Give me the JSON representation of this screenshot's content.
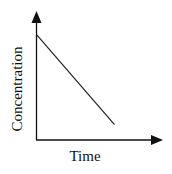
{
  "chart_data": {
    "type": "line",
    "title": "",
    "xlabel": "Time",
    "ylabel": "Concentration",
    "grid": false,
    "legend": null,
    "axis_ticks": false,
    "series": [
      {
        "name": "Concentration vs Time",
        "description": "Linear decrease (zero-order kinetics)",
        "x": [
          0,
          0.62
        ],
        "y": [
          0.82,
          0.12
        ]
      }
    ],
    "xlim": [
      0,
      1
    ],
    "ylim": [
      0,
      1
    ]
  },
  "colors": {
    "axis": "#111111",
    "line": "#222222",
    "background": "#ffffff"
  }
}
